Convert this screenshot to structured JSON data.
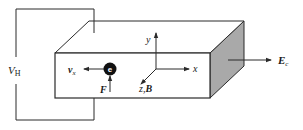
{
  "diagram": {
    "labels": {
      "hall_voltage": "V",
      "hall_voltage_sub": "H",
      "velocity": "v",
      "velocity_sub": "x",
      "electron": "e",
      "force": "F",
      "axis_y": "y",
      "axis_x": "x",
      "axis_z": "z",
      "axis_z_sep": ",",
      "field_b": "B",
      "field_e": "E",
      "field_e_sub": "c"
    },
    "colors": {
      "line": "#2a2a2a",
      "shaded_face": "#a9a9a9",
      "electron_fill": "#111111",
      "electron_text": "#ffffff",
      "background": "#ffffff"
    }
  }
}
